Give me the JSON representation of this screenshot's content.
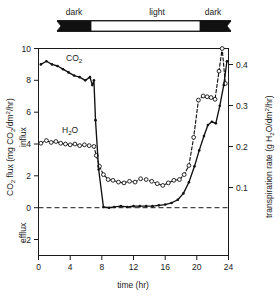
{
  "figure": {
    "phase_bar": {
      "segments": [
        {
          "label": "dark",
          "start_hr": 0,
          "end_hr": 3.6,
          "kind": "dark"
        },
        {
          "label": "light",
          "start_hr": 3.6,
          "end_hr": 20.6,
          "kind": "light"
        },
        {
          "label": "dark",
          "start_hr": 20.6,
          "end_hr": 24,
          "kind": "dark"
        }
      ]
    },
    "colors": {
      "ink": "#111111",
      "background": "#ffffff",
      "dark_segment": "#111111",
      "light_segment": "#ffffff"
    }
  },
  "chart_data": {
    "type": "line",
    "title": "",
    "xlabel": "time (hr)",
    "ylabel": "CO2 flux (mg CO2/dm2/hr)",
    "ylabel_parts": {
      "prefix": "CO",
      "sub1": "2",
      "mid": " flux (mg CO",
      "sub2": "2",
      "suffix_a": "/dm",
      "sup": "2",
      "suffix_b": "/hr)"
    },
    "ylabel_right": "transpiration rate (g H2O/dm2/hr)",
    "ylabel_right_parts": {
      "prefix": "transpiration rate (g H",
      "sub": "2",
      "mid": "O/dm",
      "sup": "2",
      "suffix": "/hr)"
    },
    "direction_labels": {
      "positive": "influx",
      "negative": "efflux"
    },
    "xlim": [
      0,
      24
    ],
    "ylim": [
      -3,
      10
    ],
    "ylim_right": [
      -0.1154,
      0.3846
    ],
    "xticks": [
      0,
      4,
      8,
      12,
      16,
      20,
      24
    ],
    "xtick_labels": [
      "0",
      "4",
      "8",
      "12",
      "16",
      "20",
      "24"
    ],
    "yticks": [
      10,
      8,
      6,
      4,
      2,
      0,
      -2
    ],
    "ytick_labels": [
      "10",
      "8",
      "6",
      "4",
      "2",
      "0",
      "2"
    ],
    "yticks_right": [
      0.4,
      0.3,
      0.2,
      0.1
    ],
    "ytick_labels_right": [
      "0.4",
      "0.3",
      "0.2",
      "0.1"
    ],
    "grid": false,
    "legend_position": "inline-annotations",
    "zero_reference_line": 0,
    "series": [
      {
        "name": "CO2",
        "label": "CO2",
        "axis": "left",
        "style": "solid",
        "marker": "filled-circle",
        "x": [
          0.3,
          1.0,
          1.7,
          2.4,
          3.1,
          3.8,
          4.5,
          5.2,
          5.9,
          6.5,
          6.8,
          7.0,
          7.2,
          7.6,
          8.2,
          8.9,
          9.6,
          10.4,
          11.2,
          12.0,
          12.8,
          13.6,
          14.4,
          15.2,
          16.0,
          16.8,
          17.6,
          18.3,
          19.0,
          19.7,
          20.3,
          20.9,
          21.4,
          21.9,
          22.4,
          22.9,
          23.4,
          23.8
        ],
        "values": [
          9.0,
          9.2,
          9.0,
          8.9,
          8.7,
          8.5,
          8.3,
          8.2,
          8.0,
          8.2,
          7.7,
          8.0,
          5.5,
          2.4,
          0.05,
          0.0,
          0.05,
          0.1,
          0.05,
          0.1,
          0.1,
          0.1,
          0.1,
          0.15,
          0.2,
          0.3,
          0.5,
          0.9,
          1.6,
          2.6,
          3.6,
          4.5,
          5.2,
          5.4,
          5.3,
          6.4,
          7.7,
          9.2
        ]
      },
      {
        "name": "H2O",
        "label": "H2O",
        "axis": "right",
        "style": "dashed",
        "marker": "open-circle",
        "x": [
          0.3,
          1.0,
          1.6,
          2.2,
          2.8,
          3.4,
          4.0,
          4.6,
          5.2,
          5.8,
          6.4,
          7.0,
          7.3,
          7.7,
          8.2,
          8.8,
          9.4,
          10.1,
          10.8,
          11.5,
          12.2,
          12.9,
          13.6,
          14.3,
          15.0,
          15.7,
          16.4,
          17.1,
          17.8,
          18.4,
          19.0,
          19.6,
          20.2,
          20.8,
          21.3,
          21.8,
          22.3,
          22.8,
          23.2,
          23.6
        ],
        "values": [
          0.156,
          0.162,
          0.158,
          0.16,
          0.156,
          0.154,
          0.152,
          0.154,
          0.15,
          0.152,
          0.15,
          0.148,
          0.126,
          0.1,
          0.08,
          0.068,
          0.066,
          0.062,
          0.06,
          0.064,
          0.062,
          0.07,
          0.068,
          0.064,
          0.058,
          0.054,
          0.06,
          0.066,
          0.068,
          0.08,
          0.102,
          0.17,
          0.26,
          0.27,
          0.268,
          0.266,
          0.262,
          0.33,
          0.388,
          0.3
        ],
        "values_left_scale": [
          4.05,
          4.22,
          4.1,
          4.16,
          4.05,
          4.0,
          3.95,
          4.0,
          3.9,
          3.95,
          3.9,
          3.85,
          3.28,
          2.6,
          2.08,
          1.77,
          1.72,
          1.61,
          1.56,
          1.66,
          1.61,
          1.82,
          1.77,
          1.66,
          1.51,
          1.4,
          1.56,
          1.72,
          1.77,
          2.08,
          2.65,
          4.42,
          6.76,
          7.02,
          6.97,
          6.92,
          6.81,
          8.58,
          10.09,
          7.8
        ]
      }
    ],
    "annotations": [
      {
        "text": "CO2",
        "series": "CO2",
        "x_hr": 2.0,
        "y": 9.8
      },
      {
        "text": "H2O",
        "series": "H2O",
        "x_hr": 2.0,
        "y": 5.1
      }
    ]
  }
}
